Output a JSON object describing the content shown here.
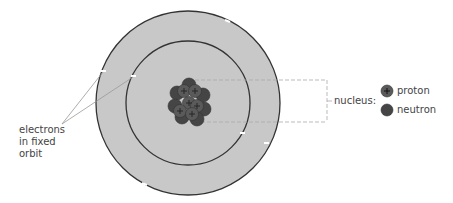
{
  "labels": {
    "electrons_line1": "electrons",
    "electrons_line2": "in fixed",
    "electrons_line3": "orbit",
    "nucleus": "nucleus:",
    "proton": "proton",
    "neutron": "neutron"
  },
  "colors": {
    "orbit_fill": "#c8c8c8",
    "orbit_stroke": "#333333",
    "proton": "#5a5a5a",
    "neutron": "#454545",
    "leader": "#aaaaaa"
  }
}
